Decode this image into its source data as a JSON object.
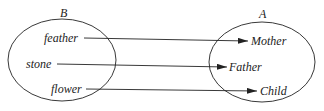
{
  "diagram": {
    "sets": [
      {
        "name": "B",
        "elements": [
          "feather",
          "stone",
          "flower"
        ]
      },
      {
        "name": "A",
        "elements": [
          "Mother",
          "Father",
          "Child"
        ]
      }
    ],
    "mappings": [
      {
        "from": "feather",
        "to": "Mother"
      },
      {
        "from": "stone",
        "to": "Father"
      },
      {
        "from": "flower",
        "to": "Child"
      }
    ]
  }
}
